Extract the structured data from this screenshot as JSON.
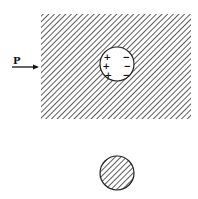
{
  "diagram": {
    "force_label": "P",
    "hole_charges": {
      "left": [
        "+",
        "+",
        "+"
      ],
      "right": [
        "−",
        "−",
        "−"
      ]
    },
    "colors": {
      "hatch": "#333333",
      "outline": "#222222",
      "background": "#ffffff"
    },
    "elements": {
      "slab": "hatched rectangular slab with circular hole",
      "hole": "circular hole with surface charges",
      "plug": "separate hatched circular plug"
    }
  }
}
